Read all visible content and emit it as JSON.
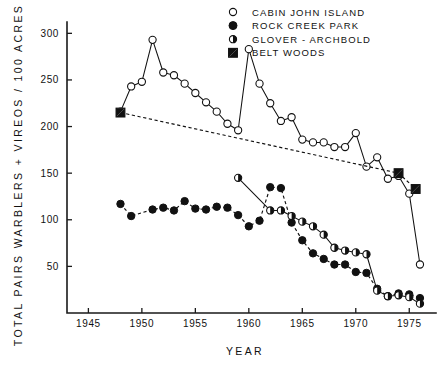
{
  "chart_data": {
    "type": "line",
    "title": "",
    "xlabel": "YEAR",
    "ylabel": "TOTAL PAIRS WARBLERS + VIREOS / 100 ACRES",
    "xlim": [
      1943,
      1977.5
    ],
    "ylim": [
      0,
      310
    ],
    "xticks": [
      1945,
      1950,
      1955,
      1960,
      1965,
      1970,
      1975
    ],
    "xticklabels": [
      "1945",
      "1950",
      "1955",
      "1960",
      "1965",
      "1970",
      "1975"
    ],
    "yticks": [
      50,
      100,
      150,
      200,
      250,
      300
    ],
    "yticklabels": [
      "50",
      "100",
      "150",
      "200",
      "250",
      "300"
    ],
    "grid": false,
    "legend_position": "top-right",
    "series": [
      {
        "name": "CABIN JOHN ISLAND",
        "marker": "open-circle",
        "linestyle": "solid",
        "points": [
          [
            1948,
            216
          ],
          [
            1949,
            243
          ],
          [
            1950,
            248
          ],
          [
            1951,
            293
          ],
          [
            1952,
            258
          ],
          [
            1953,
            255
          ],
          [
            1954,
            246
          ],
          [
            1955,
            236
          ],
          [
            1956,
            226
          ],
          [
            1957,
            216
          ],
          [
            1958,
            203
          ],
          [
            1959,
            196
          ],
          [
            1960,
            283
          ],
          [
            1961,
            246
          ],
          [
            1962,
            225
          ],
          [
            1963,
            206
          ],
          [
            1964,
            210
          ],
          [
            1965,
            186
          ],
          [
            1966,
            183
          ],
          [
            1967,
            183
          ],
          [
            1968,
            178
          ],
          [
            1969,
            178
          ],
          [
            1970,
            193
          ],
          [
            1971,
            157
          ],
          [
            1972,
            167
          ],
          [
            1973,
            144
          ],
          [
            1974,
            147
          ],
          [
            1975,
            128
          ],
          [
            1976,
            52
          ]
        ]
      },
      {
        "name": "ROCK CREEK PARK",
        "marker": "filled-circle",
        "linestyle": "dashed",
        "points": [
          [
            1948,
            117
          ],
          [
            1949,
            104
          ],
          [
            1951,
            111
          ],
          [
            1952,
            113
          ],
          [
            1953,
            110
          ],
          [
            1954,
            120
          ],
          [
            1955,
            112
          ],
          [
            1956,
            111
          ],
          [
            1957,
            114
          ],
          [
            1958,
            113
          ],
          [
            1959,
            105
          ],
          [
            1960,
            93
          ],
          [
            1961,
            99
          ],
          [
            1962,
            135
          ],
          [
            1963,
            134
          ],
          [
            1964,
            97
          ],
          [
            1965,
            78
          ],
          [
            1966,
            64
          ],
          [
            1967,
            58
          ],
          [
            1968,
            52
          ],
          [
            1969,
            52
          ],
          [
            1970,
            44
          ],
          [
            1971,
            43
          ],
          [
            1972,
            26
          ],
          [
            1973,
            18
          ],
          [
            1974,
            21
          ],
          [
            1975,
            20
          ],
          [
            1976,
            16
          ]
        ]
      },
      {
        "name": "GLOVER - ARCHBOLD",
        "marker": "half-circle",
        "linestyle": "solid",
        "points": [
          [
            1959,
            145
          ],
          [
            1962,
            110
          ],
          [
            1963,
            110
          ],
          [
            1964,
            104
          ],
          [
            1965,
            98
          ],
          [
            1966,
            93
          ],
          [
            1967,
            84
          ],
          [
            1968,
            70
          ],
          [
            1969,
            67
          ],
          [
            1970,
            65
          ],
          [
            1971,
            63
          ],
          [
            1972,
            24
          ],
          [
            1973,
            18
          ],
          [
            1974,
            19
          ],
          [
            1975,
            17
          ],
          [
            1976,
            10
          ]
        ]
      },
      {
        "name": "BELT WOODS",
        "marker": "half-square",
        "linestyle": "dashed",
        "points": [
          [
            1948,
            215
          ],
          [
            1974,
            150
          ],
          [
            1975.6,
            133
          ]
        ]
      }
    ]
  },
  "legend": {
    "items": [
      {
        "label": "CABIN JOHN ISLAND",
        "marker": "open-circle"
      },
      {
        "label": "ROCK CREEK PARK",
        "marker": "filled-circle"
      },
      {
        "label": "GLOVER - ARCHBOLD",
        "marker": "half-circle"
      },
      {
        "label": "BELT WOODS",
        "marker": "half-square"
      }
    ]
  }
}
